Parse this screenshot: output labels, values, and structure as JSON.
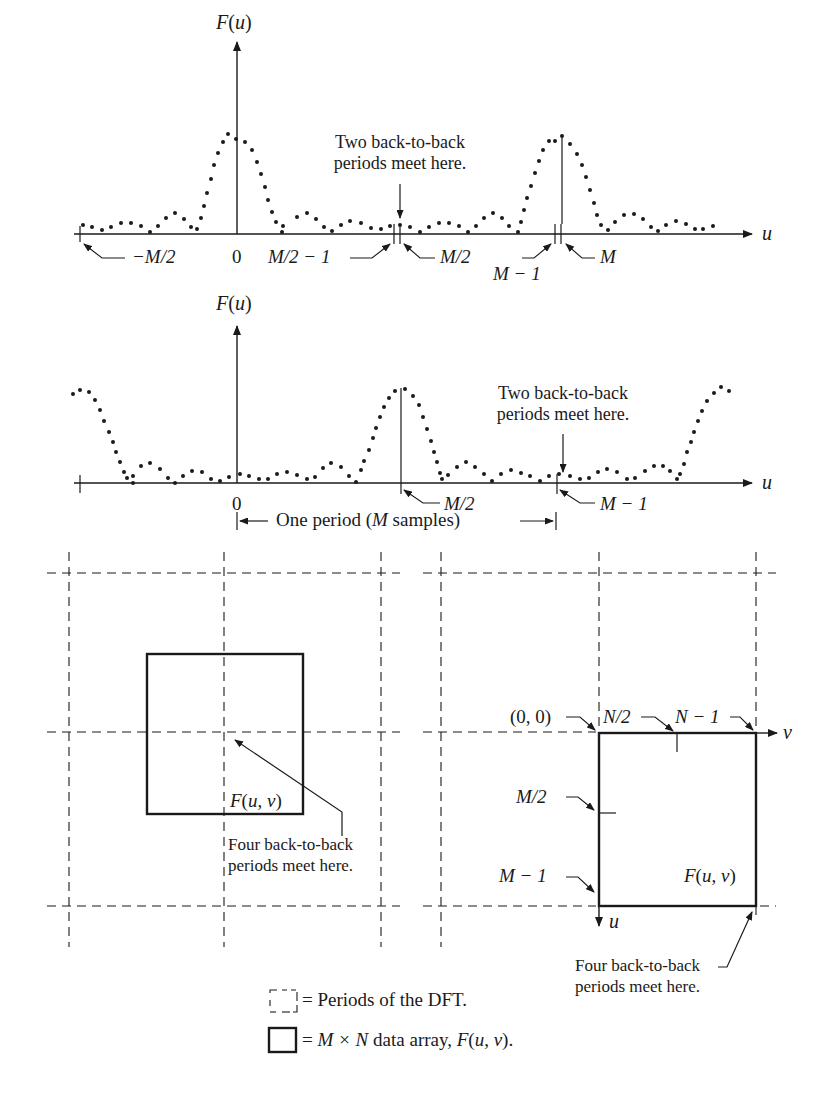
{
  "top_strip_text": "g , , , p , ,",
  "plot1": {
    "y_label": "F(u)",
    "x_label": "u",
    "annotation": [
      "Two back-to-back",
      "periods meet here."
    ],
    "ticks": {
      "neg_half": "−M/2",
      "zero": "0",
      "half_minus_one": "M/2 − 1",
      "half": "M/2",
      "m_minus_one": "M − 1",
      "m": "M"
    }
  },
  "plot2": {
    "y_label": "F(u)",
    "x_label": "u",
    "annotation": [
      "Two back-to-back",
      "periods meet here."
    ],
    "ticks": {
      "zero": "0",
      "half": "M/2",
      "m_minus_one": "M − 1"
    },
    "period_label": "One period (M samples)"
  },
  "grid_left": {
    "array_label": "F(u, v)",
    "annotation": [
      "Four back-to-back",
      "periods meet here."
    ]
  },
  "grid_right": {
    "origin_label": "(0, 0)",
    "n_half": "N/2",
    "n_minus_one": "N − 1",
    "v_axis": "v",
    "u_axis": "u",
    "m_half": "M/2",
    "m_minus_one": "M − 1",
    "array_label": "F(u, v)",
    "annotation": [
      "Four back-to-back",
      "periods meet here."
    ]
  },
  "legend": {
    "dashed": "= Periods of the DFT.",
    "solid_prefix": "= ",
    "solid_math": "M × N",
    "solid_text": " data array, ",
    "solid_fn": "F(u, v)",
    "solid_end": "."
  },
  "colors": {
    "ink": "#1a1a1a",
    "background": "#ffffff"
  }
}
